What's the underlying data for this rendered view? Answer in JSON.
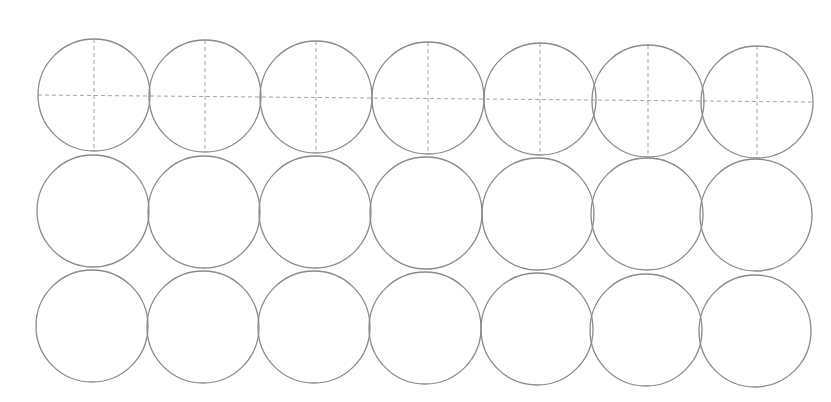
{
  "sheet": {
    "title": "",
    "background": "#ffffff",
    "stroke_color": "#8a8a8a",
    "guide_color": "#9a9a9a",
    "radius": 56,
    "rows": [
      {
        "label": "row-1",
        "has_guides": true,
        "centers": [
          [
            94,
            95
          ],
          [
            205,
            96
          ],
          [
            316,
            97
          ],
          [
            428,
            98
          ],
          [
            540,
            99
          ],
          [
            648,
            101
          ],
          [
            757,
            102
          ]
        ]
      },
      {
        "label": "row-2",
        "has_guides": false,
        "centers": [
          [
            93,
            211
          ],
          [
            204,
            212
          ],
          [
            315,
            212
          ],
          [
            426,
            213
          ],
          [
            538,
            214
          ],
          [
            647,
            214
          ],
          [
            756,
            215
          ]
        ]
      },
      {
        "label": "row-3",
        "has_guides": false,
        "centers": [
          [
            92,
            326
          ],
          [
            203,
            327
          ],
          [
            314,
            327
          ],
          [
            425,
            328
          ],
          [
            537,
            329
          ],
          [
            646,
            330
          ],
          [
            755,
            331
          ]
        ]
      }
    ]
  }
}
